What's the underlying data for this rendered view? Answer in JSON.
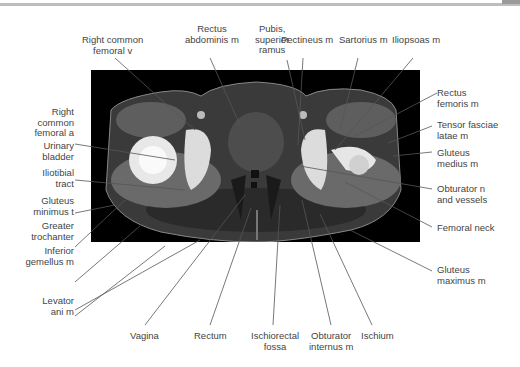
{
  "figure": {
    "type": "axial CT of pelvis",
    "labels_top": [
      {
        "id": "right-common-femoral-v",
        "text": "Right common\nfemoral v"
      },
      {
        "id": "rectus-abdominis-m",
        "text": "Rectus\nabdominis m"
      },
      {
        "id": "pubis-superior-ramus",
        "text": "Pubis,\nsuperior\nramus"
      },
      {
        "id": "pectineus-m",
        "text": "Pectineus m"
      },
      {
        "id": "sartorius-m",
        "text": "Sartorius m"
      },
      {
        "id": "iliopsoas-m",
        "text": "Iliopsoas m"
      }
    ],
    "labels_left": [
      {
        "id": "right-common-femoral-a",
        "text": "Right\ncommon\nfemoral a"
      },
      {
        "id": "urinary-bladder",
        "text": "Urinary\nbladder"
      },
      {
        "id": "iliotibial-tract",
        "text": "Iliotibial\ntract"
      },
      {
        "id": "gluteus-minimus",
        "text": "Gluteus\nminimus t"
      },
      {
        "id": "greater-trochanter",
        "text": "Greater\ntrochanter"
      },
      {
        "id": "inferior-gemellus-m",
        "text": "Inferior\ngemellus m"
      },
      {
        "id": "levator-ani-m",
        "text": "Levator\nani m"
      }
    ],
    "labels_right": [
      {
        "id": "rectus-femoris-m",
        "text": "Rectus\nfemoris m"
      },
      {
        "id": "tensor-fasciae-latae-m",
        "text": "Tensor fasciae\nlatae m"
      },
      {
        "id": "gluteus-medius-m",
        "text": "Gluteus\nmedius m"
      },
      {
        "id": "obturator-n-vessels",
        "text": "Obturator n\nand vessels"
      },
      {
        "id": "femoral-neck",
        "text": "Femoral neck"
      },
      {
        "id": "gluteus-maximus-m",
        "text": "Gluteus\nmaximus m"
      }
    ],
    "labels_bottom": [
      {
        "id": "vagina",
        "text": "Vagina"
      },
      {
        "id": "rectum",
        "text": "Rectum"
      },
      {
        "id": "ischiorectal-fossa",
        "text": "Ischiorectal\nfossa"
      },
      {
        "id": "obturator-internus-m",
        "text": "Obturator\ninternus m"
      },
      {
        "id": "ischium",
        "text": "Ischium"
      }
    ]
  }
}
